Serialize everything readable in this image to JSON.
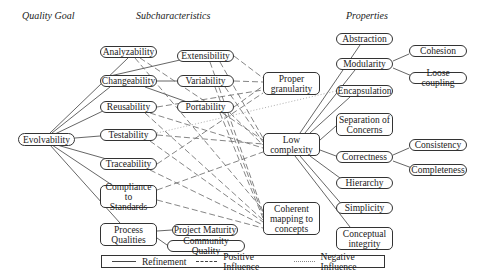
{
  "headers": {
    "quality_goal": "Quality Goal",
    "subcharacteristics": "Subcharacteristics",
    "properties": "Properties"
  },
  "nodes": {
    "evolvability": "Evolvability",
    "analyzability": "Analyzability",
    "changeability": "Changeability",
    "reusability": "Reusability",
    "testability": "Testability",
    "traceability": "Traceability",
    "compliance": "Compliance to\nStandards",
    "process_qualities": "Process\nQualities",
    "extensibility": "Extensibility",
    "variability": "Variability",
    "portability": "Portability",
    "project_maturity": "Project Maturity",
    "community_quality": "Community Quality",
    "proper_granularity": "Proper\ngranularity",
    "low_complexity": "Low\ncomplexity",
    "coherent_mapping": "Coherent\nmapping to\nconcepts",
    "abstraction": "Abstraction",
    "modularity": "Modularity",
    "cohesion": "Cohesion",
    "loose_coupling": "Loose coupling",
    "encapsulation": "Encapsulation",
    "separation_of_concerns": "Separation of\nConcerns",
    "correctness": "Correctness",
    "consistency": "Consistency",
    "completeness": "Completeness",
    "hierarchy": "Hierarchy",
    "simplicity": "Simplicity",
    "conceptual_integrity": "Conceptual\nintegrity"
  },
  "legend": {
    "refinement": "Refinement",
    "positive": "Positive Influence",
    "negative": "Negative Influence"
  },
  "colors": {
    "line": "#444444",
    "dotted": "#888888",
    "border": "#333333"
  }
}
